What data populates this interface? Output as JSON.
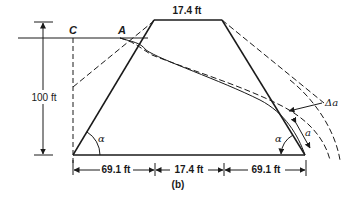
{
  "figure": {
    "caption": "(b)",
    "top_width_label": "17.4 ft",
    "height_label": "100 ft",
    "base_dims": [
      {
        "label": "69.1 ft"
      },
      {
        "label": "17.4 ft"
      },
      {
        "label": "69.1 ft"
      }
    ],
    "points": {
      "c_label": "C",
      "a_label": "A"
    },
    "angle_left": "α",
    "angle_right": "α",
    "delta_a_label": "Δa",
    "a_label": "a"
  },
  "colors": {
    "stroke": "#1a1a1a",
    "background": "#ffffff"
  }
}
